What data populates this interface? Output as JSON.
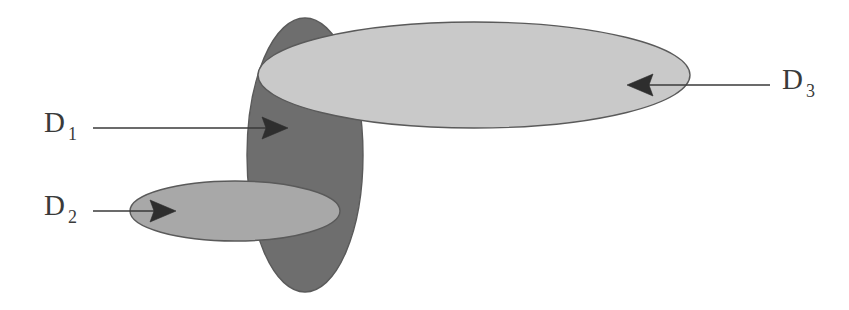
{
  "diagram": {
    "background_color": "#ffffff",
    "width": 849,
    "height": 310,
    "outline_color": "#5a5a5a",
    "arrow_color": "#2e2e2e",
    "leader_color": "#3a3a3a",
    "regions": [
      {
        "id": "d1",
        "label": "D",
        "subscript": "1",
        "label_full": "D1",
        "fill_color": "#6e6e6e",
        "shape": "ellipse",
        "orientation": "vertical",
        "cx": 305,
        "cy": 155,
        "rx": 58,
        "ry": 137,
        "z_order": 1
      },
      {
        "id": "d2",
        "label": "D",
        "subscript": "2",
        "label_full": "D2",
        "fill_color": "#a8a8a8",
        "shape": "ellipse",
        "orientation": "horizontal",
        "cx": 235,
        "cy": 211,
        "rx": 105,
        "ry": 30,
        "z_order": 2
      },
      {
        "id": "d3",
        "label": "D",
        "subscript": "3",
        "label_full": "D3",
        "fill_color": "#c9c9c9",
        "shape": "ellipse",
        "orientation": "horizontal",
        "cx": 474,
        "cy": 75,
        "rx": 216,
        "ry": 53,
        "z_order": 3
      }
    ],
    "pointers": [
      {
        "id": "pointer-d1",
        "for_region": "d1",
        "direction": "right",
        "line_start_x": 93,
        "line_start_y": 128,
        "line_end_x": 270,
        "line_end_y": 128,
        "tip_x": 288,
        "tip_y": 128
      },
      {
        "id": "pointer-d2",
        "for_region": "d2",
        "direction": "right",
        "line_start_x": 93,
        "line_start_y": 211,
        "line_end_x": 158,
        "line_end_y": 211,
        "tip_x": 176,
        "tip_y": 211
      },
      {
        "id": "pointer-d3",
        "for_region": "d3",
        "direction": "left",
        "line_start_x": 770,
        "line_start_y": 85,
        "line_end_x": 645,
        "line_end_y": 85,
        "tip_x": 627,
        "tip_y": 85
      }
    ],
    "labels": [
      {
        "id": "label-d1",
        "base": "D",
        "sub": "1",
        "x": 44,
        "y": 132,
        "sub_x": 68,
        "sub_y": 140
      },
      {
        "id": "label-d2",
        "base": "D",
        "sub": "2",
        "x": 44,
        "y": 215,
        "sub_x": 68,
        "sub_y": 223
      },
      {
        "id": "label-d3",
        "base": "D",
        "sub": "3",
        "x": 782,
        "y": 89,
        "sub_x": 806,
        "sub_y": 97
      }
    ]
  }
}
